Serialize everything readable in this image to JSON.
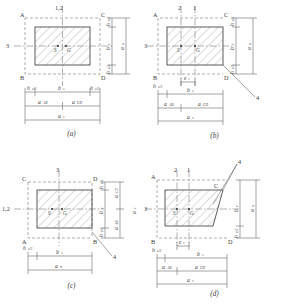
{
  "figure": {
    "type": "engineering-diagram",
    "hatch_angle_deg": 45,
    "colors": {
      "outline": "#4a4a4a",
      "dashed": "#8a8a8a",
      "hatch": "#9a9a9a",
      "dimension": "#6a6a6a",
      "text": "#3c3c3c",
      "background": "#ffffff"
    }
  },
  "panels": [
    {
      "id": "a",
      "caption": "(a)",
      "case": "interior",
      "corners": {
        "tl": "A",
        "tr": "C",
        "bl": "B",
        "br": "D"
      },
      "sections": {
        "top": "1,2",
        "left": "3",
        "leader": ""
      },
      "centroids": {
        "shear": "S",
        "geometric": "G"
      },
      "v_dims": [
        {
          "label": "h",
          "sub": "c/2",
          "pos": "top"
        },
        {
          "label": "b",
          "sub": "c",
          "pos": "mid"
        },
        {
          "label": "h",
          "sub": "c/2",
          "pos": "bot"
        },
        {
          "label": "a",
          "sub": "n",
          "pos": "outer"
        }
      ],
      "h_dims": [
        {
          "label": "h",
          "sub": "c/2",
          "pos": "left"
        },
        {
          "label": "b",
          "sub": "s",
          "pos": "center"
        },
        {
          "label": "h",
          "sub": "c/2",
          "pos": "right"
        },
        {
          "label": "a",
          "sub": "AB",
          "pos": "row2-left"
        },
        {
          "label": "a",
          "sub": "CD",
          "pos": "row2-right"
        },
        {
          "label": "a",
          "sub": "s",
          "pos": "row3"
        }
      ]
    },
    {
      "id": "b",
      "caption": "(b)",
      "case": "edge-right",
      "corners": {
        "tl": "A",
        "tr": "C",
        "bl": "B",
        "br": "D"
      },
      "sections": {
        "top_left": "2",
        "top_right": "1",
        "left": "3",
        "leader": "4"
      },
      "centroids": {
        "shear": "S",
        "geometric": "G"
      },
      "v_dims": [
        {
          "label": "h",
          "sub": "c/2",
          "pos": "top"
        },
        {
          "label": "b",
          "sub": "c",
          "pos": "mid"
        },
        {
          "label": "h",
          "sub": "c/2",
          "pos": "bot"
        },
        {
          "label": "a",
          "sub": "n",
          "pos": "outer"
        }
      ],
      "h_dims": [
        {
          "label": "e",
          "sub": "s",
          "pos": "ecc"
        },
        {
          "label": "h",
          "sub": "c/2",
          "pos": "left"
        },
        {
          "label": "b",
          "sub": "s",
          "pos": "center"
        },
        {
          "label": "a",
          "sub": "AB",
          "pos": "row2-left"
        },
        {
          "label": "a",
          "sub": "CD",
          "pos": "row2-right"
        },
        {
          "label": "a",
          "sub": "s",
          "pos": "row3"
        }
      ]
    },
    {
      "id": "c",
      "caption": "(c)",
      "case": "edge-bottom",
      "corners": {
        "tl": "C",
        "tr": "D",
        "bl": "A",
        "br": "B"
      },
      "sections": {
        "top": "3",
        "left": "1,2",
        "leader": "4"
      },
      "centroids": {
        "shear": "S",
        "geometric": "G"
      },
      "v_dims": [
        {
          "label": "h",
          "sub": "c/2",
          "pos": "top"
        },
        {
          "label": "b",
          "sub": "c",
          "pos": "mid"
        },
        {
          "label": "h",
          "sub": "c/2",
          "pos": "bot"
        },
        {
          "label": "a",
          "sub": "CD",
          "pos": "outer-top"
        },
        {
          "label": "a",
          "sub": "AB",
          "pos": "outer-bot"
        },
        {
          "label": "a",
          "sub": "s",
          "pos": "outer"
        }
      ],
      "h_dims": [
        {
          "label": "h",
          "sub": "c/2",
          "pos": "left"
        },
        {
          "label": "b",
          "sub": "s",
          "pos": "center"
        },
        {
          "label": "a",
          "sub": "n",
          "pos": "row2"
        }
      ]
    },
    {
      "id": "d",
      "caption": "(d)",
      "case": "corner",
      "corners": {
        "tl": "A",
        "tr": "C",
        "bl": "B",
        "br": "D"
      },
      "sections": {
        "top_left": "2",
        "top_right": "1",
        "left": "3",
        "leader": "4"
      },
      "centroids": {
        "shear": "S",
        "geometric": "G"
      },
      "v_dims": [
        {
          "label": "b",
          "sub": "c",
          "pos": "mid"
        },
        {
          "label": "h",
          "sub": "c/2",
          "pos": "bot"
        },
        {
          "label": "a",
          "sub": "n",
          "pos": "outer"
        }
      ],
      "h_dims": [
        {
          "label": "e",
          "sub": "s",
          "pos": "ecc"
        },
        {
          "label": "h",
          "sub": "c/2",
          "pos": "left"
        },
        {
          "label": "b",
          "sub": "s",
          "pos": "center"
        },
        {
          "label": "a",
          "sub": "AB",
          "pos": "row2-left"
        },
        {
          "label": "a",
          "sub": "CD",
          "pos": "row2-right"
        },
        {
          "label": "a",
          "sub": "s",
          "pos": "row3"
        }
      ]
    }
  ]
}
